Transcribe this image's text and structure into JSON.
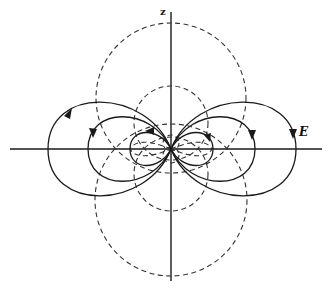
{
  "figure": {
    "axis_labels": {
      "vertical": "z",
      "field": "E"
    },
    "colors": {
      "line": "#1a1a1a",
      "dashed": "#333333",
      "background": "#ffffff"
    },
    "origin": [
      171,
      149
    ],
    "dashed_circles": [
      {
        "name": "upper-large",
        "cx": 171,
        "cy": 98,
        "r": 75
      },
      {
        "name": "lower-large",
        "cx": 171,
        "cy": 200,
        "r": 76
      },
      {
        "name": "upper-small",
        "cx": 171,
        "cy": 123,
        "r": 37
      },
      {
        "name": "lower-small",
        "cx": 171,
        "cy": 174,
        "r": 37
      }
    ],
    "field_lobes": [
      {
        "name": "outer",
        "extent_x": 125,
        "half_height": 48
      },
      {
        "name": "middle",
        "extent_x": 84,
        "half_height": 33
      },
      {
        "name": "inner",
        "extent_x": 42,
        "half_height": 16
      }
    ]
  }
}
